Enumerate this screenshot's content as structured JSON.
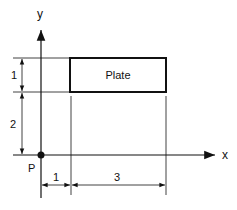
{
  "diagram": {
    "axes": {
      "x_label": "x",
      "y_label": "y"
    },
    "origin_label": "P",
    "plate_label": "Plate",
    "dimensions": {
      "plate_height": "1",
      "plate_offset_y": "2",
      "plate_offset_x": "1",
      "plate_width": "3"
    },
    "colors": {
      "line": "#111111",
      "background": "#ffffff"
    }
  }
}
